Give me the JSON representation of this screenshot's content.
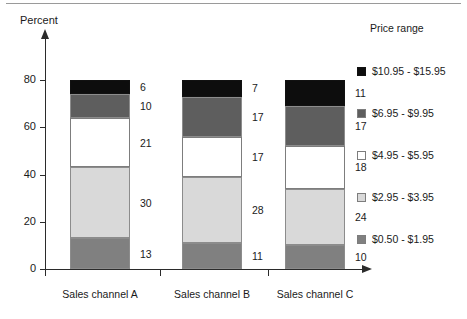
{
  "border": {
    "top_rule_color": "#9a9a9a"
  },
  "chart_data": {
    "type": "bar",
    "subtype": "stacked-bar-vertical",
    "title": "",
    "xlabel": "",
    "ylabel": "Percent",
    "ylim": [
      0,
      80
    ],
    "yticks": [
      0,
      20,
      40,
      60,
      80
    ],
    "grid": false,
    "legend_position": "right",
    "legend_title": "Price range",
    "categories": [
      "Sales channel A",
      "Sales channel B",
      "Sales channel C"
    ],
    "series": [
      {
        "name": "$0.50 - $1.95",
        "color": "#808080",
        "values": [
          13,
          11,
          10
        ]
      },
      {
        "name": "$2.95 - $3.95",
        "color": "#d9d9d9",
        "values": [
          30,
          28,
          24
        ]
      },
      {
        "name": "$4.95 - $5.95",
        "color": "#ffffff",
        "values": [
          21,
          17,
          18
        ]
      },
      {
        "name": "$6.95 - $9.95",
        "color": "#5e5e5e",
        "values": [
          10,
          17,
          17
        ]
      },
      {
        "name": "$10.95 - $15.95",
        "color": "#0d0d0d",
        "values": [
          6,
          7,
          11
        ]
      }
    ],
    "stack_totals": [
      80,
      80,
      80
    ],
    "annotations": [
      {
        "category": "Sales channel A",
        "series": "$0.50 - $1.95",
        "value": "13"
      },
      {
        "category": "Sales channel A",
        "series": "$2.95 - $3.95",
        "value": "30"
      },
      {
        "category": "Sales channel A",
        "series": "$4.95 - $5.95",
        "value": "21"
      },
      {
        "category": "Sales channel A",
        "series": "$6.95 - $9.95",
        "value": "10"
      },
      {
        "category": "Sales channel A",
        "series": "$10.95 - $15.95",
        "value": "6"
      },
      {
        "category": "Sales channel B",
        "series": "$0.50 - $1.95",
        "value": "11"
      },
      {
        "category": "Sales channel B",
        "series": "$2.95 - $3.95",
        "value": "28"
      },
      {
        "category": "Sales channel B",
        "series": "$4.95 - $5.95",
        "value": "17"
      },
      {
        "category": "Sales channel B",
        "series": "$6.95 - $9.95",
        "value": "17"
      },
      {
        "category": "Sales channel B",
        "series": "$10.95 - $15.95",
        "value": "7"
      },
      {
        "category": "Sales channel C",
        "series": "$0.50 - $1.95",
        "value": "10"
      },
      {
        "category": "Sales channel C",
        "series": "$2.95 - $3.95",
        "value": "24"
      },
      {
        "category": "Sales channel C",
        "series": "$4.95 - $5.95",
        "value": "18"
      },
      {
        "category": "Sales channel C",
        "series": "$6.95 - $9.95",
        "value": "17"
      },
      {
        "category": "Sales channel C",
        "series": "$10.95 - $15.95",
        "value": "11"
      }
    ]
  },
  "axis": {
    "y_title": "Percent",
    "y_tick_labels": [
      "0",
      "20",
      "40",
      "60",
      "80"
    ],
    "x_tick_labels": [
      "Sales channel A",
      "Sales channel B",
      "Sales channel C"
    ]
  },
  "legend": {
    "title": "Price range",
    "entries": [
      {
        "label": "$10.95 - $15.95",
        "color": "#0d0d0d"
      },
      {
        "label": "$6.95 - $9.95",
        "color": "#5e5e5e"
      },
      {
        "label": "$4.95 - $5.95",
        "color": "#ffffff"
      },
      {
        "label": "$2.95 - $3.95",
        "color": "#d9d9d9"
      },
      {
        "label": "$0.50 - $1.95",
        "color": "#808080"
      }
    ]
  }
}
